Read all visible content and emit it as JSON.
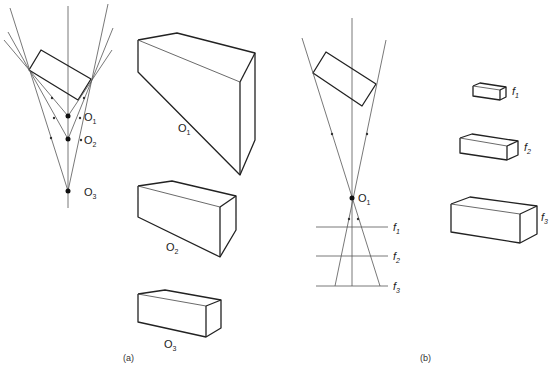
{
  "panel_a": {
    "caption": "(a)",
    "points": [
      {
        "label_main": "O",
        "label_sub": "1"
      },
      {
        "label_main": "O",
        "label_sub": "2"
      },
      {
        "label_main": "O",
        "label_sub": "3"
      }
    ],
    "views": [
      {
        "label_main": "O",
        "label_sub": "1"
      },
      {
        "label_main": "O",
        "label_sub": "2"
      },
      {
        "label_main": "O",
        "label_sub": "3"
      }
    ]
  },
  "panel_b": {
    "caption": "(b)",
    "point": {
      "label_main": "O",
      "label_sub": "1"
    },
    "planes": [
      {
        "label_main": "f",
        "label_sub": "1"
      },
      {
        "label_main": "f",
        "label_sub": "2"
      },
      {
        "label_main": "f",
        "label_sub": "3"
      }
    ],
    "views": [
      {
        "label_main": "f",
        "label_sub": "1"
      },
      {
        "label_main": "f",
        "label_sub": "2"
      },
      {
        "label_main": "f",
        "label_sub": "3"
      }
    ]
  }
}
